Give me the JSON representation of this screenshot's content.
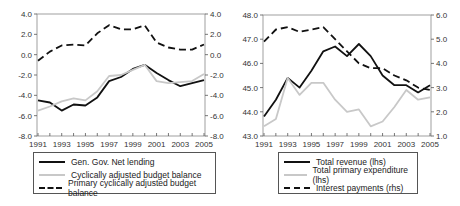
{
  "chart_data": [
    {
      "type": "line",
      "title": "",
      "x": [
        1991,
        1992,
        1993,
        1994,
        1995,
        1996,
        1997,
        1998,
        1999,
        2000,
        2001,
        2002,
        2003,
        2004,
        2005
      ],
      "x_tick_labels": [
        "1991",
        "1993",
        "1995",
        "1997",
        "1999",
        "2001",
        "2003",
        "2005"
      ],
      "ylim_left": [
        -8.0,
        4.0
      ],
      "ylim_right": [
        -8.0,
        4.0
      ],
      "y_tick_labels": [
        "4.0",
        "2.0",
        "0.0",
        "-2.0",
        "-4.0",
        "-6.0",
        "-8.0"
      ],
      "grid": false,
      "legend_position": "below",
      "series": [
        {
          "name": "Gen. Gov. Net lending",
          "style": "solid-black",
          "values": [
            -4.5,
            -4.7,
            -5.5,
            -4.9,
            -5.0,
            -4.2,
            -2.6,
            -2.2,
            -1.4,
            -1.0,
            -1.8,
            -2.5,
            -3.1,
            -2.8,
            -2.5
          ]
        },
        {
          "name": "Cyclically adjusted budget balance",
          "style": "solid-lightgray",
          "values": [
            -5.5,
            -5.1,
            -4.6,
            -4.3,
            -4.5,
            -3.6,
            -2.1,
            -2.0,
            -1.5,
            -1.0,
            -2.6,
            -2.8,
            -2.7,
            -2.6,
            -1.9
          ]
        },
        {
          "name": "Primary cyclically adjusted budget balance",
          "style": "dashed-black",
          "values": [
            -0.6,
            0.3,
            0.9,
            1.0,
            0.9,
            2.1,
            2.9,
            2.5,
            2.5,
            2.9,
            1.2,
            0.7,
            0.5,
            0.5,
            1.0
          ]
        }
      ]
    },
    {
      "type": "line",
      "title": "",
      "x": [
        1991,
        1992,
        1993,
        1994,
        1995,
        1996,
        1997,
        1998,
        1999,
        2000,
        2001,
        2002,
        2003,
        2004,
        2005
      ],
      "x_tick_labels": [
        "1991",
        "1993",
        "1995",
        "1997",
        "1999",
        "2001",
        "2003",
        "2005"
      ],
      "ylim_left": [
        43.0,
        48.0
      ],
      "ylim_right": [
        1.0,
        6.0
      ],
      "y_tick_labels_left": [
        "48.0",
        "47.0",
        "46.0",
        "45.0",
        "44.0",
        "43.0"
      ],
      "y_tick_labels_right": [
        "6.0",
        "5.0",
        "4.0",
        "3.0",
        "2.0",
        "1.0"
      ],
      "grid": false,
      "legend_position": "below",
      "series": [
        {
          "name": "Total revenue (lhs)",
          "axis": "left",
          "style": "solid-black",
          "values": [
            43.8,
            44.5,
            45.4,
            45.0,
            45.7,
            46.5,
            46.7,
            46.3,
            46.8,
            46.3,
            45.5,
            45.1,
            45.1,
            44.8,
            45.1
          ]
        },
        {
          "name": "Total primary expenditure (lhs)",
          "axis": "left",
          "style": "solid-lightgray",
          "values": [
            43.4,
            43.7,
            45.4,
            44.7,
            45.2,
            45.2,
            44.5,
            44.0,
            44.1,
            43.4,
            43.6,
            44.2,
            44.9,
            44.5,
            44.6
          ]
        },
        {
          "name": "Interest payments (rhs)",
          "axis": "right",
          "style": "dashed-black",
          "values": [
            4.9,
            5.4,
            5.5,
            5.3,
            5.4,
            5.5,
            5.0,
            4.5,
            4.0,
            3.8,
            3.8,
            3.5,
            3.3,
            3.0,
            2.9
          ]
        }
      ]
    }
  ],
  "legends": {
    "left": [
      "Gen. Gov. Net lending",
      "Cyclically adjusted budget balance",
      "Primary cyclically adjusted budget balance"
    ],
    "right": [
      "Total revenue (lhs)",
      "Total primary expenditure (lhs)",
      "Interest payments (rhs)"
    ]
  }
}
